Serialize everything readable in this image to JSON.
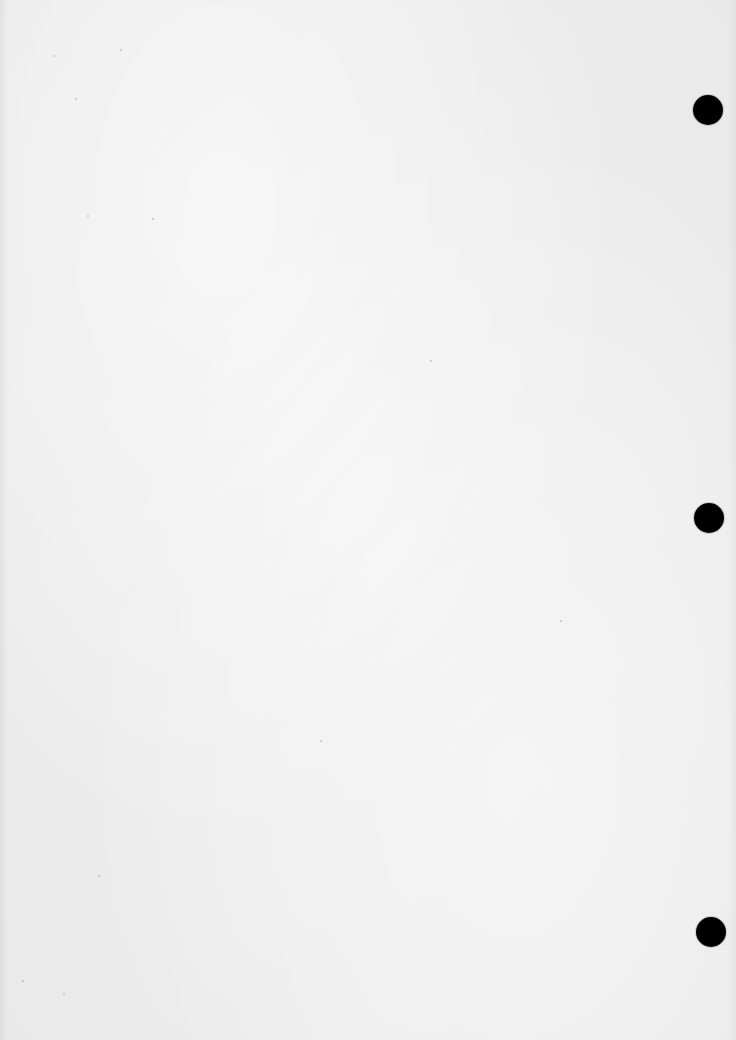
{
  "document": {
    "type": "scanned-blank-page",
    "paper_color": "#ececec",
    "text_content": ""
  },
  "punch_holes": [
    {
      "cx": 708,
      "cy": 110,
      "r": 15,
      "color": "#000000"
    },
    {
      "cx": 709,
      "cy": 518,
      "r": 15,
      "color": "#000000"
    },
    {
      "cx": 711,
      "cy": 932,
      "r": 15,
      "color": "#000000"
    }
  ]
}
